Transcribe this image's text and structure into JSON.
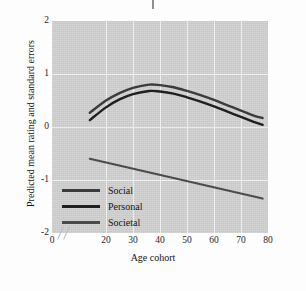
{
  "chart_data": {
    "type": "line",
    "title": "",
    "xlabel": "Age cohort",
    "ylabel": "Predicted mean rating and standard errors",
    "xlim": [
      0,
      80
    ],
    "ylim": [
      -2,
      2
    ],
    "xticks": [
      "0",
      "20",
      "30",
      "40",
      "50",
      "60",
      "70",
      "80"
    ],
    "xtick_values": [
      0,
      20,
      30,
      40,
      50,
      60,
      70,
      80
    ],
    "yticks": [
      "2",
      "1",
      "0",
      "-1",
      "-2"
    ],
    "ytick_values": [
      2,
      1,
      0,
      -1,
      -2
    ],
    "grid": true,
    "axis_break": true,
    "legend_position": "lower left",
    "panel_color": "#d2d2d2",
    "gridline_color": "#f4f4f4",
    "series": [
      {
        "name": "Social",
        "color": "#3b3b3b",
        "x": [
          14,
          20,
          25,
          30,
          36,
          40,
          45,
          50,
          55,
          60,
          65,
          70,
          75,
          78
        ],
        "values": [
          0.27,
          0.5,
          0.64,
          0.74,
          0.8,
          0.79,
          0.75,
          0.68,
          0.6,
          0.51,
          0.41,
          0.31,
          0.21,
          0.17
        ]
      },
      {
        "name": "Personal",
        "color": "#1f1f1f",
        "x": [
          14,
          20,
          25,
          30,
          36,
          40,
          45,
          50,
          55,
          60,
          65,
          70,
          75,
          78
        ],
        "values": [
          0.13,
          0.37,
          0.52,
          0.62,
          0.68,
          0.67,
          0.63,
          0.56,
          0.48,
          0.39,
          0.29,
          0.19,
          0.09,
          0.04
        ]
      },
      {
        "name": "Societal",
        "color": "#4b4b4b",
        "x": [
          14,
          78
        ],
        "values": [
          -0.6,
          -1.35
        ]
      }
    ]
  },
  "legend": {
    "items": [
      {
        "label": "Social",
        "color": "#3b3b3b"
      },
      {
        "label": "Personal",
        "color": "#1f1f1f"
      },
      {
        "label": "Societal",
        "color": "#4b4b4b"
      }
    ]
  }
}
